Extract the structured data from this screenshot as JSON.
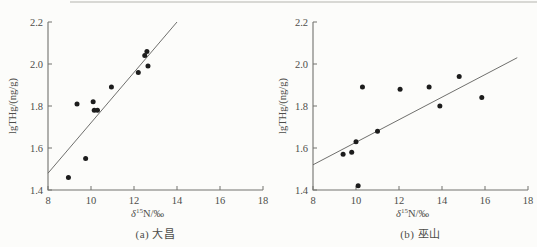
{
  "figure": {
    "background": "#fcfcfa",
    "colors": {
      "point": "#1c1c1c",
      "trendline": "#5f5f5c",
      "axis": "#72726e",
      "text": "#4d4d49"
    }
  },
  "chart_data": [
    {
      "type": "scatter",
      "title": "(a) 大昌",
      "xlabel": {
        "prefix_italic": "δ",
        "superscript": "15",
        "suffix": "N/‰"
      },
      "ylabel": "lgTHg/(ng/g)",
      "xlim": [
        8,
        18
      ],
      "ylim": [
        1.4,
        2.2
      ],
      "xticks": [
        8,
        10,
        12,
        14,
        16,
        18
      ],
      "yticks": [
        1.4,
        1.6,
        1.8,
        2.0,
        2.2
      ],
      "grid": false,
      "legend": null,
      "points": [
        [
          8.95,
          1.46
        ],
        [
          9.35,
          1.81
        ],
        [
          9.75,
          1.55
        ],
        [
          10.1,
          1.82
        ],
        [
          10.15,
          1.78
        ],
        [
          10.3,
          1.78
        ],
        [
          10.95,
          1.89
        ],
        [
          12.2,
          1.96
        ],
        [
          12.5,
          2.04
        ],
        [
          12.6,
          2.06
        ],
        [
          12.65,
          1.99
        ]
      ],
      "trendline": {
        "x1": 8,
        "y1": 1.48,
        "x2": 14,
        "y2": 2.2
      }
    },
    {
      "type": "scatter",
      "title": "(b) 巫山",
      "xlabel": {
        "prefix_italic": "δ",
        "superscript": "15",
        "suffix": "N/‰"
      },
      "ylabel": "lgTHg/(ng/g)",
      "xlim": [
        8,
        18
      ],
      "ylim": [
        1.4,
        2.2
      ],
      "xticks": [
        8,
        10,
        12,
        14,
        16,
        18
      ],
      "yticks": [
        1.4,
        1.6,
        1.8,
        2.0,
        2.2
      ],
      "grid": false,
      "legend": null,
      "points": [
        [
          9.4,
          1.57
        ],
        [
          9.8,
          1.58
        ],
        [
          10.0,
          1.63
        ],
        [
          10.1,
          1.42
        ],
        [
          10.3,
          1.89
        ],
        [
          11.0,
          1.68
        ],
        [
          12.05,
          1.88
        ],
        [
          13.4,
          1.89
        ],
        [
          13.9,
          1.8
        ],
        [
          14.8,
          1.94
        ],
        [
          15.85,
          1.84
        ]
      ],
      "trendline": {
        "x1": 8,
        "y1": 1.52,
        "x2": 17.5,
        "y2": 2.03
      }
    }
  ]
}
